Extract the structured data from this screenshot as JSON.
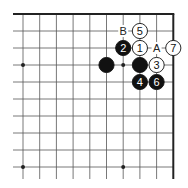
{
  "diagram": {
    "type": "go-board-corner",
    "grid": {
      "columns": 10,
      "rows": 10,
      "x0": 23,
      "y0": 14,
      "dx": 16.7,
      "dy": 17,
      "line_extend_left": 13,
      "line_extend_bottom": 179,
      "edges": [
        "top",
        "right"
      ]
    },
    "hoshi": [
      {
        "col": 0,
        "row": 3
      },
      {
        "col": 0,
        "row": 9
      },
      {
        "col": 6,
        "row": 9
      },
      {
        "col": 6,
        "row": 3
      }
    ],
    "stones": [
      {
        "color": "black",
        "col": 5,
        "row": 3,
        "label": ""
      },
      {
        "color": "black",
        "col": 7,
        "row": 3,
        "label": ""
      },
      {
        "color": "white",
        "col": 7,
        "row": 2,
        "label": "1"
      },
      {
        "color": "black",
        "col": 6,
        "row": 2,
        "label": "2"
      },
      {
        "color": "white",
        "col": 8,
        "row": 3,
        "label": "3"
      },
      {
        "color": "black",
        "col": 7,
        "row": 4,
        "label": "4"
      },
      {
        "color": "white",
        "col": 7,
        "row": 1,
        "label": "5"
      },
      {
        "color": "black",
        "col": 8,
        "row": 4,
        "label": "6"
      },
      {
        "color": "white",
        "col": 9,
        "row": 2,
        "label": "7"
      }
    ],
    "letters": [
      {
        "col": 6,
        "row": 1,
        "label": "B"
      },
      {
        "col": 8,
        "row": 2,
        "label": "A"
      }
    ],
    "colors": {
      "line": "#555555",
      "edge": "#222222",
      "black_stone": "#111111",
      "white_stone": "#ffffff"
    }
  }
}
